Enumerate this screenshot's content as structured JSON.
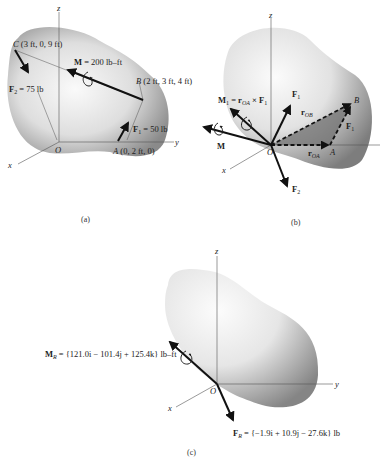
{
  "figure": {
    "panels": [
      {
        "id": "a",
        "caption": "(a)",
        "axes": {
          "x": "x",
          "y": "y",
          "z": "z",
          "origin": "O"
        },
        "points": {
          "C": {
            "name": "C",
            "coords": "(3 ft, 0, 9 ft)"
          },
          "B": {
            "name": "B",
            "coords": "(2 ft, 3 ft, 4 ft)"
          },
          "A": {
            "name": "A",
            "coords": "(0, 2 ft, 0)"
          }
        },
        "labels": {
          "moment": "M = 200 lb–ft",
          "moment_symbol": "M",
          "moment_value": " = 200 lb–ft",
          "f2_symbol": "F",
          "f2_sub": "2",
          "f2_value": " = 75 lb",
          "f1_symbol": "F",
          "f1_sub": "1",
          "f1_value": " = 50 lb"
        }
      },
      {
        "id": "b",
        "caption": "(b)",
        "axes": {
          "x": "x",
          "y": "",
          "z": "z",
          "origin": "O"
        },
        "labels": {
          "m1_symbol": "M",
          "m1_sub": "1",
          "m1_eq": " = r",
          "m1_eq_sub": "OA",
          "m1_cross": " × F",
          "m1_cross_sub": "1",
          "f1_symbol": "F",
          "f1_sub": "1",
          "f1b_symbol": "F",
          "f1b_sub": "1",
          "rob_symbol": "r",
          "rob_sub": "OB",
          "roa_symbol": "r",
          "roa_sub": "OA",
          "point_a": "A",
          "point_b": "B",
          "m_symbol": "M",
          "f2_symbol": "F",
          "f2_sub": "2"
        }
      },
      {
        "id": "c",
        "caption": "(c)",
        "axes": {
          "x": "x",
          "y": "y",
          "z": "z",
          "origin": "O"
        },
        "labels": {
          "mr_symbol": "M",
          "mr_sub": "R",
          "mr_value": " = {121.0i − 101.4j + 125.4k} lb–ft",
          "fr_symbol": "F",
          "fr_sub": "R",
          "fr_value": " = {−1.9i + 10.9j − 27.6k} lb"
        }
      }
    ],
    "colors": {
      "body_light": "#f4f4f4",
      "body_dark": "#8c8c8c",
      "vector": "#111111",
      "triangle_fill": "#6e6e6e"
    }
  }
}
